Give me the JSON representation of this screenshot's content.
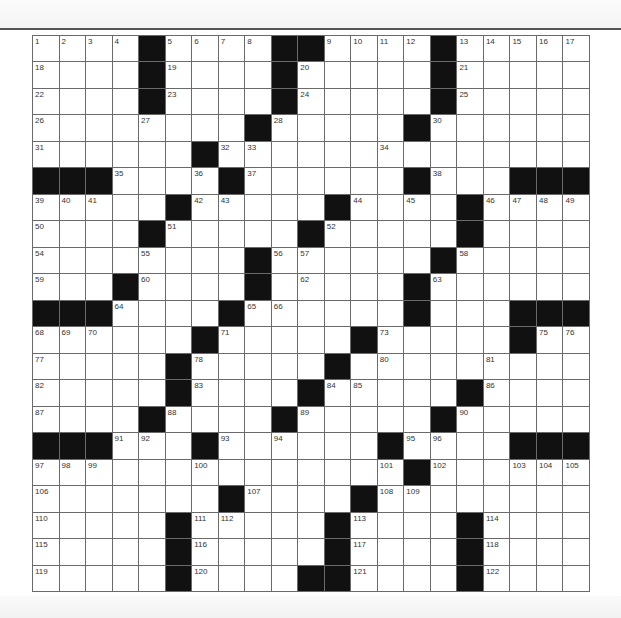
{
  "puzzle": {
    "rows": 21,
    "cols": 21,
    "grid": [
      "....#....##....#.....",
      "....#....#.....#.....",
      "....#....#.....#.....",
      "........#.....#......",
      "......#..............",
      "###....#......#...###",
      ".....#.....#....#....",
      "....#.....#.....#....",
      "........#......#.....",
      "...#....#.....#......",
      "###....#......#...###",
      "......#.....#.....#..",
      ".....#.....#.........",
      ".....#....#.....#....",
      "....#....#.....#.....",
      "###...#......#....###",
      "..............#......",
      ".......#....#........",
      ".....#.....#....#....",
      ".....#.....#....#....",
      ".....#....##....#...."
    ],
    "numbers": {
      "0,0": "1",
      "0,1": "2",
      "0,2": "3",
      "0,3": "4",
      "0,5": "5",
      "0,6": "6",
      "0,7": "7",
      "0,8": "8",
      "0,11": "9",
      "0,12": "10",
      "0,13": "11",
      "0,14": "12",
      "0,16": "13",
      "0,17": "14",
      "0,18": "15",
      "0,19": "16",
      "0,20": "17",
      "1,0": "18",
      "1,5": "19",
      "1,10": "20",
      "1,16": "21",
      "2,0": "22",
      "2,5": "23",
      "2,10": "24",
      "2,16": "25",
      "3,0": "26",
      "3,4": "27",
      "3,9": "28",
      "3,14": "29",
      "3,15": "30",
      "4,0": "31",
      "4,7": "32",
      "4,8": "33",
      "4,13": "34",
      "5,3": "35",
      "5,6": "36",
      "5,8": "37",
      "5,15": "38",
      "6,0": "39",
      "6,1": "40",
      "6,2": "41",
      "6,6": "42",
      "6,7": "43",
      "6,12": "44",
      "6,14": "45",
      "6,17": "46",
      "6,18": "47",
      "6,19": "48",
      "6,20": "49",
      "7,0": "50",
      "7,5": "51",
      "7,11": "52",
      "7,16": "53",
      "8,0": "54",
      "8,4": "55",
      "8,9": "56",
      "8,10": "57",
      "8,16": "58",
      "9,0": "59",
      "9,4": "60",
      "9,8": "61",
      "9,10": "62",
      "9,15": "63",
      "10,3": "64",
      "10,8": "65",
      "10,9": "66",
      "10,14": "67",
      "11,0": "68",
      "11,1": "69",
      "11,2": "70",
      "11,7": "71",
      "11,12": "72",
      "11,13": "73",
      "11,18": "74",
      "11,19": "75",
      "11,20": "76",
      "12,0": "77",
      "12,6": "78",
      "12,11": "79",
      "12,13": "80",
      "12,17": "81",
      "13,0": "82",
      "13,6": "83",
      "13,11": "84",
      "13,12": "85",
      "13,17": "86",
      "14,0": "87",
      "14,5": "88",
      "14,10": "89",
      "14,16": "90",
      "15,3": "91",
      "15,4": "92",
      "15,7": "93",
      "15,9": "94",
      "15,14": "95",
      "15,15": "96",
      "16,0": "97",
      "16,1": "98",
      "16,2": "99",
      "16,6": "100",
      "16,13": "101",
      "16,15": "102",
      "16,18": "103",
      "16,19": "104",
      "16,20": "105",
      "17,0": "106",
      "17,8": "107",
      "17,13": "108",
      "17,14": "109",
      "18,0": "110",
      "18,6": "111",
      "18,7": "112",
      "18,12": "113",
      "18,17": "114",
      "19,0": "115",
      "19,6": "116",
      "19,12": "117",
      "19,17": "118",
      "20,0": "119",
      "20,6": "120",
      "20,12": "121",
      "20,17": "122"
    }
  }
}
